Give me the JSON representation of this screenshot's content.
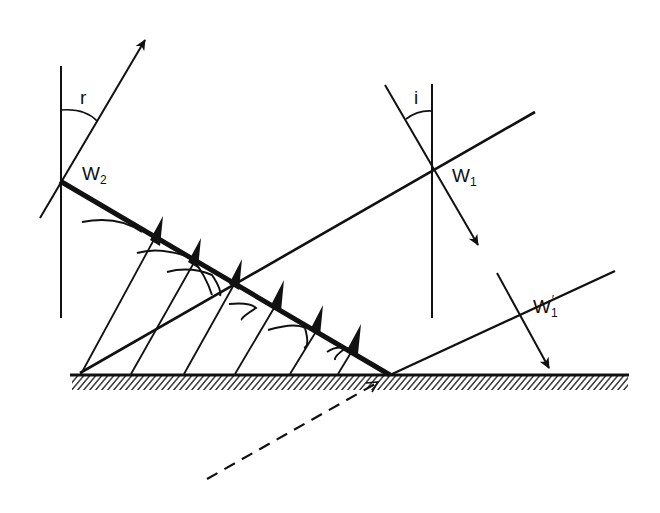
{
  "diagram": {
    "title": "",
    "labels": {
      "r": "r",
      "i": "i",
      "w2_main": "W",
      "w2_sub": "2",
      "w1_main": "W",
      "w1_sub": "1",
      "w1p_main": "W",
      "w1p_sub": "1",
      "w1p_prime": "′"
    },
    "colors": {
      "ink": "#111111",
      "background": "#ffffff"
    },
    "elements": [
      "reflecting-surface",
      "incident-wavefront",
      "reflected-wavefront",
      "incident-ray-W1",
      "incident-ray-W1-prime",
      "reflected-ray-W2",
      "normal-at-W1",
      "normal-at-W2",
      "angle-i-arc",
      "angle-r-arc",
      "huygens-wavelets",
      "dashed-extension"
    ]
  }
}
